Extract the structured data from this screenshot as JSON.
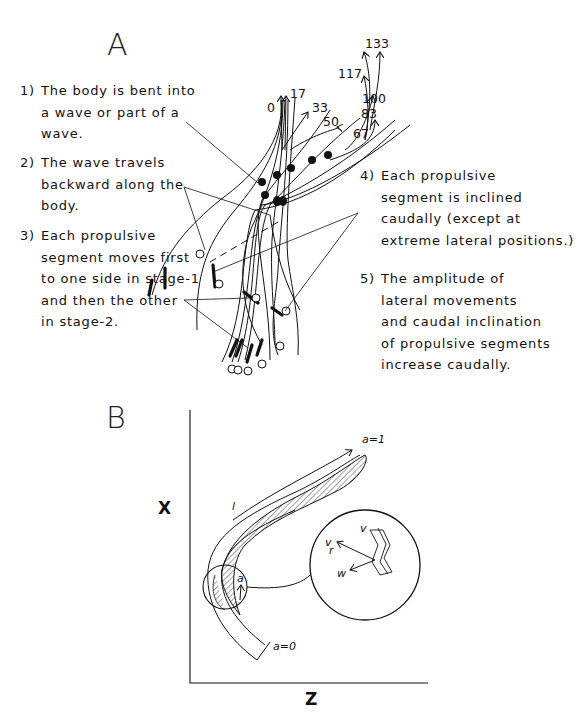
{
  "panel_a": {
    "label": "A",
    "notes": [
      {
        "num": "1)",
        "lines": [
          "The body is bent into",
          "a wave or part of a",
          "wave."
        ]
      },
      {
        "num": "2)",
        "lines": [
          "The wave travels",
          "backward along the",
          "body."
        ]
      },
      {
        "num": "3)",
        "lines": [
          "Each propulsive",
          "segment moves first",
          "to one side in stage-1",
          "and then the other",
          "in stage-2."
        ]
      },
      {
        "num": "4)",
        "lines": [
          "Each propulsive",
          "segment is inclined",
          "caudally (except at",
          "extreme lateral positions.)"
        ]
      },
      {
        "num": "5)",
        "lines": [
          "The amplitude of",
          "lateral movements",
          "and caudal inclination",
          "of propulsive segments",
          "increase caudally."
        ]
      }
    ],
    "time_labels": [
      "0",
      "17",
      "33",
      "50",
      "67",
      "83",
      "100",
      "117",
      "133"
    ]
  },
  "panel_b": {
    "label": "B",
    "x_axis_label": "Z",
    "y_axis_label": "X",
    "body_length_label": "l",
    "head_label": "a=1",
    "tail_label": "a=0",
    "segment_label": "a",
    "vector_labels": {
      "v": "v",
      "vr": "v",
      "vr_sub": "r",
      "w": "w"
    }
  }
}
